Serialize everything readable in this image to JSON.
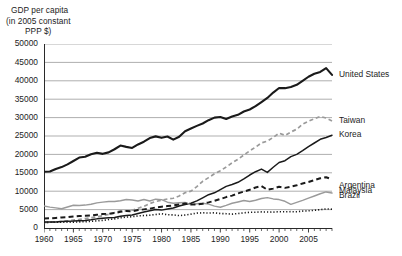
{
  "chart_data": {
    "type": "line",
    "title": "GDP per capita (in 2005 constant PPP $)",
    "title_lines": [
      "GDP per capita",
      "(in 2005 constant",
      "PPP $)"
    ],
    "xlabel": "",
    "ylabel": "GDP per capita (in 2005 constant PPP $)",
    "xlim": [
      1960,
      2009
    ],
    "ylim": [
      0,
      50000
    ],
    "grid": "horizontal",
    "legend_position": "right-inline-labels",
    "y_ticks": [
      0,
      5000,
      10000,
      15000,
      20000,
      25000,
      30000,
      35000,
      40000,
      45000,
      50000
    ],
    "y_tick_labels": [
      "0",
      "5000",
      "10000",
      "15000",
      "20000",
      "25000",
      "30000",
      "35000",
      "40000",
      "45000",
      "50000"
    ],
    "x_ticks": [
      1960,
      1965,
      1970,
      1975,
      1980,
      1985,
      1990,
      1995,
      2000,
      2005
    ],
    "x_tick_labels": [
      "1960",
      "1965",
      "1970",
      "1975",
      "1980",
      "1985",
      "1990",
      "1995",
      "2000",
      "2005"
    ],
    "x_minor_tick_interval": 1,
    "x": [
      1960,
      1961,
      1962,
      1963,
      1964,
      1965,
      1966,
      1967,
      1968,
      1969,
      1970,
      1971,
      1972,
      1973,
      1974,
      1975,
      1976,
      1977,
      1978,
      1979,
      1980,
      1981,
      1982,
      1983,
      1984,
      1985,
      1986,
      1987,
      1988,
      1989,
      1990,
      1991,
      1992,
      1993,
      1994,
      1995,
      1996,
      1997,
      1998,
      1999,
      2000,
      2001,
      2002,
      2003,
      2004,
      2005,
      2006,
      2007,
      2008,
      2009
    ],
    "series": [
      {
        "name": "United States",
        "label": "United States",
        "style": "solid",
        "color": "#1a1a1a",
        "width": 2.1,
        "label_y": 41600,
        "values": [
          15300,
          15350,
          16050,
          16550,
          17300,
          18200,
          19150,
          19350,
          20050,
          20450,
          20150,
          20550,
          21400,
          22400,
          22050,
          21750,
          22700,
          23450,
          24450,
          24900,
          24500,
          24850,
          24000,
          24800,
          26300,
          27050,
          27750,
          28400,
          29300,
          30000,
          30150,
          29600,
          30300,
          30750,
          31650,
          32200,
          33100,
          34200,
          35350,
          36800,
          38050,
          38000,
          38300,
          38900,
          40000,
          41100,
          41900,
          42400,
          43450,
          41600
        ],
        "label_anchor": 2009
      },
      {
        "name": "Taiwan",
        "label": "Taiwan",
        "style": "dashed-light",
        "color": "#9a9a9a",
        "width": 1.7,
        "label_y": 29200,
        "values": [
          1500,
          1580,
          1660,
          1780,
          1950,
          2130,
          2320,
          2550,
          2790,
          3030,
          3340,
          3720,
          4170,
          4640,
          4620,
          4820,
          5380,
          5880,
          6640,
          7190,
          7570,
          7890,
          8090,
          8700,
          9580,
          10020,
          11230,
          12690,
          13690,
          14740,
          15570,
          16560,
          17700,
          18660,
          19830,
          20960,
          21980,
          23150,
          23600,
          24630,
          25770,
          25170,
          26080,
          26850,
          28200,
          29000,
          29700,
          30300,
          29900,
          29100
        ],
        "label_anchor": 2009
      },
      {
        "name": "Korea",
        "label": "Korea",
        "style": "solid",
        "color": "#1a1a1a",
        "width": 1.5,
        "label_y": 25300,
        "values": [
          1600,
          1640,
          1650,
          1760,
          1840,
          1880,
          2000,
          2060,
          2230,
          2480,
          2620,
          2770,
          2880,
          3200,
          3410,
          3560,
          3950,
          4320,
          4700,
          5000,
          4860,
          5140,
          5440,
          5960,
          6410,
          6740,
          7380,
          8200,
          9060,
          9560,
          10420,
          11320,
          11830,
          12420,
          13350,
          14400,
          15300,
          16000,
          15100,
          16500,
          17800,
          18300,
          19400,
          20000,
          21000,
          22100,
          23100,
          24100,
          24600,
          25200
        ],
        "label_anchor": 2009
      },
      {
        "name": "Argentina",
        "label": "Argentina",
        "style": "solid-light",
        "color": "#9a9a9a",
        "width": 1.4,
        "label_y": 11600,
        "values": [
          6000,
          5680,
          5480,
          5230,
          5700,
          6190,
          6110,
          6230,
          6450,
          6840,
          7030,
          7200,
          7200,
          7400,
          7740,
          7600,
          7350,
          7730,
          7330,
          7850,
          7720,
          7010,
          6720,
          6870,
          6940,
          6260,
          6600,
          6710,
          6480,
          5950,
          5650,
          6130,
          6720,
          7080,
          7470,
          7190,
          7530,
          8020,
          8250,
          7900,
          7730,
          7260,
          6430,
          6950,
          7500,
          8100,
          8700,
          9300,
          9800,
          9500
        ],
        "label_anchor": 2009
      },
      {
        "name": "Malaysia",
        "label": "Malaysia",
        "style": "dashed-heavy",
        "color": "#1a1a1a",
        "width": 2.0,
        "label_y": 10200,
        "values": [
          2600,
          2640,
          2730,
          2850,
          2930,
          3120,
          3250,
          3300,
          3400,
          3600,
          3780,
          3880,
          4060,
          4400,
          4620,
          4520,
          4880,
          5060,
          5260,
          5580,
          5790,
          5960,
          6130,
          6390,
          6680,
          6430,
          6380,
          6600,
          6960,
          7370,
          7870,
          8400,
          8800,
          9400,
          9900,
          10400,
          11000,
          11400,
          10400,
          10700,
          11200,
          10900,
          11200,
          11600,
          12100,
          12500,
          13000,
          13500,
          13800,
          13200
        ],
        "label_anchor": 2009
      },
      {
        "name": "Brazil",
        "label": "Brazil",
        "style": "dotted",
        "color": "#1a1a1a",
        "width": 1.6,
        "label_y": 8800,
        "values": [
          1500,
          1540,
          1590,
          1560,
          1590,
          1590,
          1670,
          1700,
          1830,
          1950,
          2080,
          2290,
          2490,
          2770,
          2970,
          3070,
          3300,
          3380,
          3490,
          3670,
          3880,
          3590,
          3570,
          3370,
          3520,
          3770,
          4050,
          4130,
          4050,
          4140,
          3920,
          3890,
          3780,
          3930,
          4130,
          4250,
          4300,
          4380,
          4340,
          4320,
          4440,
          4400,
          4440,
          4410,
          4590,
          4670,
          4800,
          5000,
          5180,
          5100
        ],
        "label_anchor": 2009
      }
    ],
    "annotations": []
  }
}
